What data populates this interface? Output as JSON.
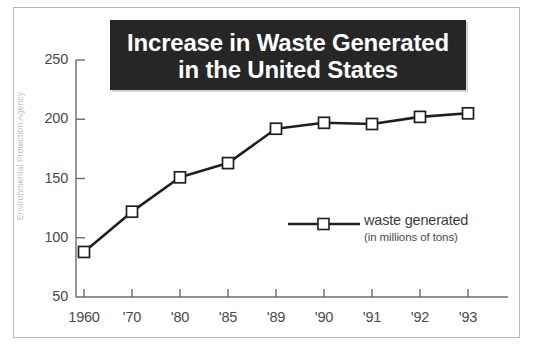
{
  "source_credit": "Environmental Protection Agency",
  "title": {
    "line1": "Increase in Waste Generated",
    "line2": "in the United States"
  },
  "legend": {
    "label": "waste generated",
    "sublabel": "(in millions of tons)"
  },
  "chart_data": {
    "type": "line",
    "title": "Increase in Waste Generated in the United States",
    "xlabel": "",
    "ylabel": "",
    "categories": [
      "1960",
      "'70",
      "'80",
      "'85",
      "'89",
      "'90",
      "'91",
      "'92",
      "'93"
    ],
    "values": [
      88,
      122,
      151,
      163,
      192,
      197,
      196,
      202,
      205
    ],
    "series": [
      {
        "name": "waste generated",
        "unit": "millions of tons",
        "values": [
          88,
          122,
          151,
          163,
          192,
          197,
          196,
          202,
          205
        ]
      }
    ],
    "ylim": [
      50,
      250
    ],
    "yticks": [
      50,
      100,
      150,
      200,
      250
    ],
    "ytick_labels": [
      "50",
      "100",
      "150",
      "200",
      "250"
    ],
    "grid": false,
    "legend_position": "center-right",
    "marker": "open-square",
    "line_color": "#1f1f1f",
    "marker_fill": "#ffffff",
    "axis_color": "#6b6b6b"
  }
}
